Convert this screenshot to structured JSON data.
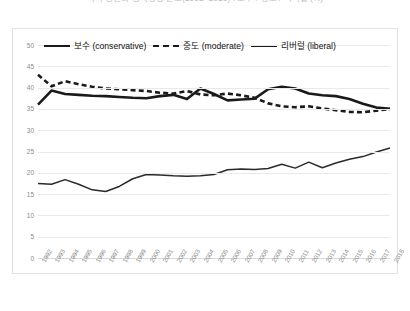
{
  "chart_data": {
    "type": "line",
    "title": "미국 성인의 정치성향 분포(1992~2018) : 보수 / 중도 / 리버럴 (%)",
    "xlabel": "",
    "ylabel": "",
    "ylim": [
      0,
      50
    ],
    "ytick_step": 5,
    "yticks": [
      50,
      45,
      40,
      35,
      30,
      25,
      20,
      15,
      10,
      5,
      0
    ],
    "grid": true,
    "legend_position": "top-inside",
    "x": [
      "1992",
      "1993",
      "1994",
      "1995",
      "1996",
      "1997",
      "1998",
      "1999",
      "2000",
      "2001",
      "2002",
      "2003",
      "2004",
      "2005",
      "2006",
      "2007",
      "2008",
      "2009",
      "2010",
      "2011",
      "2012",
      "2013",
      "2014",
      "2015",
      "2016",
      "2017",
      "2018"
    ],
    "series": [
      {
        "name": "보수 (conservative)",
        "style": "solid-thick",
        "color": "#1a1a1a",
        "values": [
          36.0,
          39.3,
          38.5,
          38.3,
          38.1,
          38.0,
          37.8,
          37.6,
          37.5,
          38.0,
          38.3,
          37.3,
          39.8,
          38.5,
          37.0,
          37.2,
          37.4,
          39.6,
          40.2,
          39.8,
          38.6,
          38.2,
          38.0,
          37.3,
          36.2,
          35.3,
          35.0
        ]
      },
      {
        "name": "중도 (moderate)",
        "style": "dashed",
        "color": "#1a1a1a",
        "values": [
          43.0,
          40.3,
          41.5,
          40.8,
          40.2,
          39.8,
          39.6,
          39.4,
          39.2,
          38.8,
          38.6,
          39.2,
          38.4,
          38.2,
          38.6,
          38.2,
          37.6,
          36.3,
          35.6,
          35.4,
          35.6,
          35.1,
          34.7,
          34.3,
          34.2,
          34.6,
          35.0
        ]
      },
      {
        "name": "리버럴 (liberal)",
        "style": "solid-thin",
        "color": "#2a2a2a",
        "values": [
          17.5,
          17.3,
          18.4,
          17.3,
          16.0,
          15.6,
          16.8,
          18.6,
          19.6,
          19.5,
          19.3,
          19.2,
          19.3,
          19.6,
          20.7,
          20.9,
          20.8,
          21.0,
          22.0,
          21.1,
          22.5,
          21.2,
          22.3,
          23.2,
          23.8,
          24.9,
          25.8
        ]
      }
    ]
  }
}
